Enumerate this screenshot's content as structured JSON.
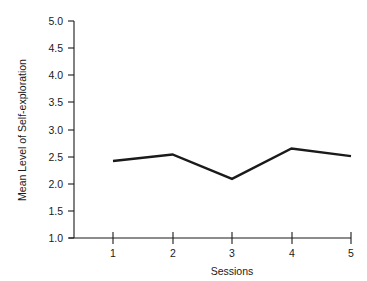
{
  "chart_data": {
    "type": "line",
    "title": "",
    "xlabel": "Sessions",
    "ylabel": "Mean Level of Self-exploration",
    "categories": [
      "1",
      "2",
      "3",
      "4",
      "5"
    ],
    "x": [
      1,
      2,
      3,
      4,
      5
    ],
    "values": [
      2.42,
      2.54,
      2.09,
      2.65,
      2.51
    ],
    "series": [
      {
        "name": "Mean Level of Self-exploration",
        "values": [
          2.42,
          2.54,
          2.09,
          2.65,
          2.51
        ]
      }
    ],
    "xlim": [
      0.6,
      5.0
    ],
    "ylim": [
      1.0,
      5.0
    ],
    "ytick_labels": [
      "5.0",
      "4.5",
      "4.0",
      "3.5",
      "3.0",
      "2.5",
      "2.0",
      "1.5",
      "1.0"
    ],
    "ytick_values": [
      5.0,
      4.5,
      4.0,
      3.5,
      3.0,
      2.5,
      2.0,
      1.5,
      1.0
    ],
    "xtick_labels": [
      "1",
      "2",
      "3",
      "4",
      "5"
    ],
    "grid": false,
    "legend": "none",
    "line_color": "#1a1a1a",
    "background_color": "#ffffff",
    "markers": false
  }
}
